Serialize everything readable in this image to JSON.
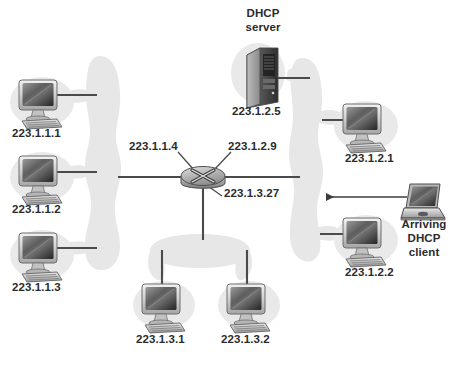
{
  "diagram": {
    "background_color": "#ffffff",
    "blob_color": "#e6e6e6",
    "line_color": "#4a4a4a",
    "text_color": "#2b2b2b"
  },
  "subnets": [
    {
      "name": "subnet-223-1-1",
      "shape": "vertical-blob",
      "x": 101,
      "y": 162,
      "width": 34,
      "height": 215
    },
    {
      "name": "subnet-223-1-2",
      "shape": "vertical-blob",
      "x": 302,
      "y": 159,
      "width": 34,
      "height": 202
    },
    {
      "name": "subnet-223-1-3",
      "shape": "horizontal-blob",
      "x": 200,
      "y": 250,
      "width": 96,
      "height": 30
    }
  ],
  "router": {
    "name": "center-router",
    "x": 203,
    "y": 176,
    "interfaces": [
      {
        "label": "223.1.1.4",
        "side": "left"
      },
      {
        "label": "223.1.2.9",
        "side": "right"
      },
      {
        "label": "223.1.3.27",
        "side": "bottom"
      }
    ]
  },
  "interface_labels": [
    {
      "id": "if-223-1-1-4",
      "text": "223.1.1.4",
      "x": 129,
      "y": 141
    },
    {
      "id": "if-223-1-2-9",
      "text": "223.1.2.9",
      "x": 227,
      "y": 141
    },
    {
      "id": "if-223-1-3-27",
      "text": "223.1.3.27",
      "x": 223,
      "y": 188
    }
  ],
  "hosts": [
    {
      "id": "host-223-1-1-1",
      "type": "desktop",
      "label": "223.1.1.1",
      "icon": "desktop-computer-icon",
      "x": 42,
      "y": 100,
      "label_x": 41,
      "label_y": 130,
      "subnet": "subnet-223-1-1"
    },
    {
      "id": "host-223-1-1-2",
      "type": "desktop",
      "label": "223.1.1.2",
      "icon": "desktop-computer-icon",
      "x": 42,
      "y": 175,
      "label_x": 41,
      "label_y": 205,
      "subnet": "subnet-223-1-1"
    },
    {
      "id": "host-223-1-1-3",
      "type": "desktop",
      "label": "223.1.1.3",
      "icon": "desktop-computer-icon",
      "x": 42,
      "y": 253,
      "label_x": 41,
      "label_y": 283,
      "subnet": "subnet-223-1-1"
    },
    {
      "id": "host-223-1-2-1",
      "type": "desktop",
      "label": "223.1.2.1",
      "icon": "desktop-computer-icon",
      "x": 363,
      "y": 124,
      "label_x": 372,
      "label_y": 155,
      "subnet": "subnet-223-1-2"
    },
    {
      "id": "host-223-1-2-2",
      "type": "desktop",
      "label": "223.1.2.2",
      "icon": "desktop-computer-icon",
      "x": 363,
      "y": 238,
      "label_x": 372,
      "label_y": 268,
      "subnet": "subnet-223-1-2"
    },
    {
      "id": "host-223-1-3-1",
      "type": "desktop",
      "label": "223.1.3.1",
      "icon": "desktop-computer-icon",
      "x": 163,
      "y": 303,
      "label_x": 163,
      "label_y": 335,
      "subnet": "subnet-223-1-3"
    },
    {
      "id": "host-223-1-3-2",
      "type": "desktop",
      "label": "223.1.3.2",
      "icon": "desktop-computer-icon",
      "x": 248,
      "y": 303,
      "label_x": 248,
      "label_y": 335,
      "subnet": "subnet-223-1-3"
    }
  ],
  "server": {
    "id": "dhcp-server",
    "icon": "server-tower-icon",
    "title_line1": "DHCP",
    "title_line2": "server",
    "title_x": 259,
    "title_y": 8,
    "label": "223.1.2.5",
    "label_x": 257,
    "label_y": 107,
    "x": 255,
    "y": 72
  },
  "client": {
    "id": "arriving-dhcp-client",
    "icon": "laptop-icon",
    "label_line1": "Arriving",
    "label_line2": "DHCP",
    "label_line3": "client",
    "label_x": 423,
    "label_y": 219,
    "x": 423,
    "y": 196,
    "arrow": {
      "from_x": 407,
      "from_y": 197,
      "to_x": 322,
      "to_y": 197,
      "direction": "left"
    }
  }
}
